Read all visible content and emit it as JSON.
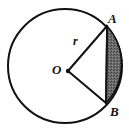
{
  "figure": {
    "type": "geometry-diagram",
    "background_color": "#ffffff",
    "stroke_color": "#111111",
    "shade_color": "#6f6f6f",
    "labels": {
      "point_a": "A",
      "point_b": "B",
      "center": "O",
      "radius": "r"
    },
    "geometry": {
      "circle": {
        "cx": 65,
        "cy": 66,
        "r": 57,
        "stroke_width": 2
      },
      "center_point": {
        "x": 68,
        "y": 71,
        "dot_radius": 2.2
      },
      "point_a": {
        "x": 107,
        "y": 26
      },
      "point_b": {
        "x": 106,
        "y": 103
      },
      "chord": {
        "x1": 107,
        "y1": 26,
        "x2": 106,
        "y2": 103
      },
      "radius_a": {
        "x1": 68,
        "y1": 71,
        "x2": 107,
        "y2": 26
      },
      "radius_b": {
        "x1": 68,
        "y1": 71,
        "x2": 106,
        "y2": 103
      },
      "shaded_segment": "M107,26 A57,57 0 0,1 106,103 L107,26 Z"
    }
  }
}
